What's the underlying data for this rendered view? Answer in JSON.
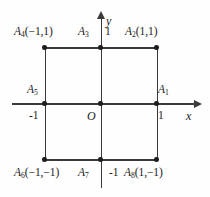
{
  "figure": {
    "type": "coordinate-geometry-diagram",
    "axes": {
      "x_name": "x",
      "y_name": "y",
      "origin_label": "O"
    },
    "ticks": {
      "y_positive": "1",
      "y_negative": "-1",
      "x_positive": "1",
      "x_negative": "-1"
    },
    "points": [
      {
        "id": "a1",
        "name": "A",
        "index": "1",
        "coords": ""
      },
      {
        "id": "a2",
        "name": "A",
        "index": "2",
        "coords": "(1,1)"
      },
      {
        "id": "a3",
        "name": "A",
        "index": "3",
        "coords": ""
      },
      {
        "id": "a4",
        "name": "A",
        "index": "4",
        "coords": "(−1,1)"
      },
      {
        "id": "a5",
        "name": "A",
        "index": "5",
        "coords": ""
      },
      {
        "id": "a6",
        "name": "A",
        "index": "6",
        "coords": "(−1,−1)"
      },
      {
        "id": "a7",
        "name": "A",
        "index": "7",
        "coords": ""
      },
      {
        "id": "a8",
        "name": "A",
        "index": "8",
        "coords": "(1,−1)"
      }
    ],
    "colors": {
      "stroke": "#3a3a3a",
      "dot": "#1d1d1d",
      "text": "#1a1a1a",
      "background": "#fefefe"
    }
  }
}
